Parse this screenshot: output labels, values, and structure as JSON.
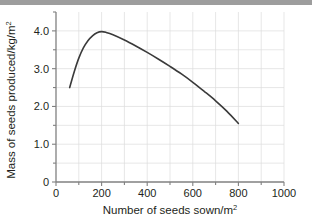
{
  "chart_data": {
    "type": "line",
    "title": "",
    "xlabel": "Number of seeds sown/m²",
    "ylabel": "Mass of seeds produced/kg/m²",
    "xlim": [
      0,
      1000
    ],
    "ylim": [
      0,
      4.5
    ],
    "grid": true,
    "legend": "none",
    "x_major_ticks": [
      0,
      200,
      400,
      600,
      800,
      1000
    ],
    "x_minor_ticks": [
      100,
      300,
      500,
      700,
      900
    ],
    "x_tick_labels": [
      "0",
      "200",
      "400",
      "600",
      "800",
      "1000"
    ],
    "y_major_ticks": [
      0,
      1.0,
      2.0,
      3.0,
      4.0
    ],
    "y_minor_ticks": [
      0.5,
      1.5,
      2.5,
      3.5
    ],
    "y_tick_labels": [
      "0",
      "1.0",
      "2.0",
      "3.0",
      "4.0"
    ],
    "series": [
      {
        "name": "seed yield curve",
        "color": "#3a3a3a",
        "points": [
          [
            60,
            2.5
          ],
          [
            80,
            2.92
          ],
          [
            100,
            3.28
          ],
          [
            120,
            3.55
          ],
          [
            140,
            3.74
          ],
          [
            160,
            3.87
          ],
          [
            180,
            3.95
          ],
          [
            200,
            3.98
          ],
          [
            220,
            3.96
          ],
          [
            250,
            3.9
          ],
          [
            300,
            3.76
          ],
          [
            350,
            3.6
          ],
          [
            400,
            3.43
          ],
          [
            450,
            3.25
          ],
          [
            500,
            3.06
          ],
          [
            550,
            2.86
          ],
          [
            600,
            2.64
          ],
          [
            650,
            2.4
          ],
          [
            700,
            2.15
          ],
          [
            750,
            1.87
          ],
          [
            800,
            1.55
          ]
        ]
      }
    ],
    "annotations": {
      "peak_x": 200,
      "peak_y": 4.0,
      "start_x": 60,
      "start_y": 2.5,
      "end_x": 800,
      "end_y": 1.55
    },
    "colors": {
      "curve": "#3a3a3a",
      "axis": "#808080",
      "grid": "#dcdcdc",
      "text": "#231f20",
      "banner": "#9d9d9d"
    }
  }
}
